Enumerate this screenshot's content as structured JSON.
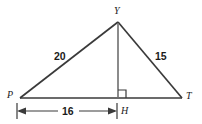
{
  "figure": {
    "kind": "geometry-diagram",
    "shape": "triangle-with-altitude",
    "background_color": "#ffffff",
    "stroke_color": "#3a3a3a",
    "text_color": "#1a1a1a"
  },
  "vertices": [
    {
      "name": "Y",
      "label": "Y",
      "x": 118,
      "y": 22,
      "role": "apex"
    },
    {
      "name": "P",
      "label": "P",
      "x": 20,
      "y": 98,
      "role": "base-left"
    },
    {
      "name": "T",
      "label": "T",
      "x": 182,
      "y": 98,
      "role": "base-right"
    },
    {
      "name": "H",
      "label": "H",
      "x": 118,
      "y": 98,
      "role": "foot-of-altitude"
    }
  ],
  "segments": [
    {
      "name": "PY",
      "label": "20",
      "from": "P",
      "to": "Y"
    },
    {
      "name": "YT",
      "label": "15",
      "from": "Y",
      "to": "T"
    },
    {
      "name": "PT",
      "label": "",
      "from": "P",
      "to": "T"
    },
    {
      "name": "YH",
      "label": "",
      "from": "Y",
      "to": "H",
      "style": "altitude"
    }
  ],
  "labels": {
    "side_py": "20",
    "side_yt": "15",
    "base_segment_ph": "16",
    "vertex_y": "Y",
    "vertex_p": "P",
    "vertex_t": "T",
    "vertex_h": "H"
  },
  "dimension": {
    "name": "PH-dimension",
    "value": "16",
    "from_x": 17,
    "to_x": 117,
    "y": 111,
    "arrows": "both"
  },
  "right_angle": {
    "at": "H",
    "marker": "square",
    "size": 8,
    "side": "right"
  }
}
